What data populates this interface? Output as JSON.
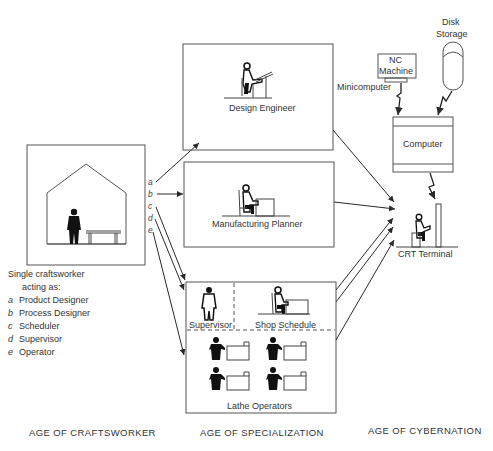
{
  "eras": {
    "craftsworker": "AGE OF CRAFTSWORKER",
    "specialization": "AGE OF SPECIALIZATION",
    "cybernation": "AGE OF CYBERNATION"
  },
  "craftsworker": {
    "caption_line1": "Single craftsworker",
    "caption_line2": "acting as:",
    "roles": [
      {
        "key": "a",
        "label": "Product Designer"
      },
      {
        "key": "b",
        "label": "Process Designer"
      },
      {
        "key": "c",
        "label": "Scheduler"
      },
      {
        "key": "d",
        "label": "Supervisor"
      },
      {
        "key": "e",
        "label": "Operator"
      }
    ]
  },
  "specialization": {
    "design_engineer": "Design Engineer",
    "manufacturing_planner": "Manufacturing Planner",
    "supervisor": "Supervisor",
    "shop_schedule": "Shop Schedule",
    "lathe_operators": "Lathe Operators"
  },
  "cybernation": {
    "nc_machine_line1": "NC",
    "nc_machine_line2": "Machine",
    "minicomputer": "Minicomputer",
    "disk_storage_line1": "Disk",
    "disk_storage_line2": "Storage",
    "computer": "Computer",
    "crt_terminal": "CRT Terminal"
  },
  "colors": {
    "line": "#3a3a3a",
    "box_border": "#555555",
    "figure": "#111111",
    "text": "#333333"
  }
}
